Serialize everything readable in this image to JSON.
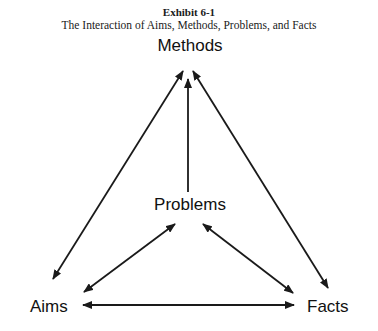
{
  "exhibit": {
    "number": "Exhibit 6-1",
    "title": "The Interaction of Aims, Methods, Problems, and Facts"
  },
  "nodes": {
    "methods": "Methods",
    "problems": "Problems",
    "aims": "Aims",
    "facts": "Facts"
  },
  "edges": [
    {
      "from": "Problems",
      "to": "Methods",
      "type": "one-way"
    },
    {
      "from": "Aims",
      "to": "Methods",
      "type": "two-way"
    },
    {
      "from": "Facts",
      "to": "Methods",
      "type": "two-way"
    },
    {
      "from": "Problems",
      "to": "Aims",
      "type": "two-way"
    },
    {
      "from": "Problems",
      "to": "Facts",
      "type": "two-way"
    },
    {
      "from": "Aims",
      "to": "Facts",
      "type": "two-way"
    }
  ]
}
